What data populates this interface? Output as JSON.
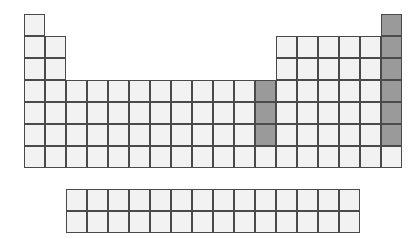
{
  "figure": {
    "name": "periodic-table-outline",
    "background_color": "#ffffff"
  },
  "colors": {
    "cell_fill": "#f2f2f2",
    "cell_border": "#4a4a4a",
    "highlight_fill": "#9a9a9a",
    "page_background": "#ffffff"
  },
  "geometry": {
    "cell_width": 21,
    "cell_height": 22,
    "main_origin_x": 24,
    "main_origin_y": 14,
    "f_block_origin_x": 66,
    "f_block_origin_y": 189,
    "f_block_columns": 14,
    "f_block_rows": 2,
    "main_columns": 18,
    "main_rows": 7
  },
  "main_block": {
    "name": "main-periodic-grid",
    "rows": [
      {
        "period": 1,
        "cells": [
          {
            "group": 1,
            "state": "plain"
          },
          {
            "group": 18,
            "state": "highlight"
          }
        ]
      },
      {
        "period": 2,
        "cells": [
          {
            "group": 1,
            "state": "plain"
          },
          {
            "group": 2,
            "state": "plain"
          },
          {
            "group": 13,
            "state": "plain"
          },
          {
            "group": 14,
            "state": "plain"
          },
          {
            "group": 15,
            "state": "plain"
          },
          {
            "group": 16,
            "state": "plain"
          },
          {
            "group": 17,
            "state": "plain"
          },
          {
            "group": 18,
            "state": "highlight"
          }
        ]
      },
      {
        "period": 3,
        "cells": [
          {
            "group": 1,
            "state": "plain"
          },
          {
            "group": 2,
            "state": "plain"
          },
          {
            "group": 13,
            "state": "plain"
          },
          {
            "group": 14,
            "state": "plain"
          },
          {
            "group": 15,
            "state": "plain"
          },
          {
            "group": 16,
            "state": "plain"
          },
          {
            "group": 17,
            "state": "plain"
          },
          {
            "group": 18,
            "state": "highlight"
          }
        ]
      },
      {
        "period": 4,
        "cells": [
          {
            "group": 1,
            "state": "plain"
          },
          {
            "group": 2,
            "state": "plain"
          },
          {
            "group": 3,
            "state": "plain"
          },
          {
            "group": 4,
            "state": "plain"
          },
          {
            "group": 5,
            "state": "plain"
          },
          {
            "group": 6,
            "state": "plain"
          },
          {
            "group": 7,
            "state": "plain"
          },
          {
            "group": 8,
            "state": "plain"
          },
          {
            "group": 9,
            "state": "plain"
          },
          {
            "group": 10,
            "state": "plain"
          },
          {
            "group": 11,
            "state": "plain"
          },
          {
            "group": 12,
            "state": "highlight"
          },
          {
            "group": 13,
            "state": "plain"
          },
          {
            "group": 14,
            "state": "plain"
          },
          {
            "group": 15,
            "state": "plain"
          },
          {
            "group": 16,
            "state": "plain"
          },
          {
            "group": 17,
            "state": "plain"
          },
          {
            "group": 18,
            "state": "highlight"
          }
        ]
      },
      {
        "period": 5,
        "cells": [
          {
            "group": 1,
            "state": "plain"
          },
          {
            "group": 2,
            "state": "plain"
          },
          {
            "group": 3,
            "state": "plain"
          },
          {
            "group": 4,
            "state": "plain"
          },
          {
            "group": 5,
            "state": "plain"
          },
          {
            "group": 6,
            "state": "plain"
          },
          {
            "group": 7,
            "state": "plain"
          },
          {
            "group": 8,
            "state": "plain"
          },
          {
            "group": 9,
            "state": "plain"
          },
          {
            "group": 10,
            "state": "plain"
          },
          {
            "group": 11,
            "state": "plain"
          },
          {
            "group": 12,
            "state": "highlight"
          },
          {
            "group": 13,
            "state": "plain"
          },
          {
            "group": 14,
            "state": "plain"
          },
          {
            "group": 15,
            "state": "plain"
          },
          {
            "group": 16,
            "state": "plain"
          },
          {
            "group": 17,
            "state": "plain"
          },
          {
            "group": 18,
            "state": "highlight"
          }
        ]
      },
      {
        "period": 6,
        "cells": [
          {
            "group": 1,
            "state": "plain"
          },
          {
            "group": 2,
            "state": "plain"
          },
          {
            "group": 3,
            "state": "plain"
          },
          {
            "group": 4,
            "state": "plain"
          },
          {
            "group": 5,
            "state": "plain"
          },
          {
            "group": 6,
            "state": "plain"
          },
          {
            "group": 7,
            "state": "plain"
          },
          {
            "group": 8,
            "state": "plain"
          },
          {
            "group": 9,
            "state": "plain"
          },
          {
            "group": 10,
            "state": "plain"
          },
          {
            "group": 11,
            "state": "plain"
          },
          {
            "group": 12,
            "state": "highlight"
          },
          {
            "group": 13,
            "state": "plain"
          },
          {
            "group": 14,
            "state": "plain"
          },
          {
            "group": 15,
            "state": "plain"
          },
          {
            "group": 16,
            "state": "plain"
          },
          {
            "group": 17,
            "state": "plain"
          },
          {
            "group": 18,
            "state": "highlight"
          }
        ]
      },
      {
        "period": 7,
        "cells": [
          {
            "group": 1,
            "state": "plain"
          },
          {
            "group": 2,
            "state": "plain"
          },
          {
            "group": 3,
            "state": "plain"
          },
          {
            "group": 4,
            "state": "plain"
          },
          {
            "group": 5,
            "state": "plain"
          },
          {
            "group": 6,
            "state": "plain"
          },
          {
            "group": 7,
            "state": "plain"
          },
          {
            "group": 8,
            "state": "plain"
          },
          {
            "group": 9,
            "state": "plain"
          },
          {
            "group": 10,
            "state": "plain"
          },
          {
            "group": 11,
            "state": "plain"
          },
          {
            "group": 12,
            "state": "plain"
          },
          {
            "group": 13,
            "state": "plain"
          },
          {
            "group": 14,
            "state": "plain"
          },
          {
            "group": 15,
            "state": "plain"
          },
          {
            "group": 16,
            "state": "plain"
          },
          {
            "group": 17,
            "state": "plain"
          },
          {
            "group": 18,
            "state": "plain"
          }
        ]
      }
    ]
  },
  "f_block": {
    "name": "f-block-grid",
    "rows": [
      {
        "series": 1,
        "cells": [
          {
            "index": 1,
            "state": "plain"
          },
          {
            "index": 2,
            "state": "plain"
          },
          {
            "index": 3,
            "state": "plain"
          },
          {
            "index": 4,
            "state": "plain"
          },
          {
            "index": 5,
            "state": "plain"
          },
          {
            "index": 6,
            "state": "plain"
          },
          {
            "index": 7,
            "state": "plain"
          },
          {
            "index": 8,
            "state": "plain"
          },
          {
            "index": 9,
            "state": "plain"
          },
          {
            "index": 10,
            "state": "plain"
          },
          {
            "index": 11,
            "state": "plain"
          },
          {
            "index": 12,
            "state": "plain"
          },
          {
            "index": 13,
            "state": "plain"
          },
          {
            "index": 14,
            "state": "plain"
          }
        ]
      },
      {
        "series": 2,
        "cells": [
          {
            "index": 1,
            "state": "plain"
          },
          {
            "index": 2,
            "state": "plain"
          },
          {
            "index": 3,
            "state": "plain"
          },
          {
            "index": 4,
            "state": "plain"
          },
          {
            "index": 5,
            "state": "plain"
          },
          {
            "index": 6,
            "state": "plain"
          },
          {
            "index": 7,
            "state": "plain"
          },
          {
            "index": 8,
            "state": "plain"
          },
          {
            "index": 9,
            "state": "plain"
          },
          {
            "index": 10,
            "state": "plain"
          },
          {
            "index": 11,
            "state": "plain"
          },
          {
            "index": 12,
            "state": "plain"
          },
          {
            "index": 13,
            "state": "plain"
          },
          {
            "index": 14,
            "state": "plain"
          }
        ]
      }
    ]
  },
  "highlighted_regions": [
    {
      "name": "group-18-column",
      "label": "Group 18 (rightmost column, periods 1-6)",
      "fill": "#9a9a9a"
    },
    {
      "name": "group-12-column",
      "label": "Group 12 (periods 4-6)",
      "fill": "#9a9a9a"
    }
  ]
}
